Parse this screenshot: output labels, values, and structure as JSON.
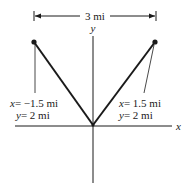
{
  "diagram": {
    "dimension": {
      "label": "3 mi"
    },
    "axes": {
      "x_label": "x",
      "y_label": "y"
    },
    "points": [
      {
        "id": "left",
        "x_var": "x",
        "x_value": "= −1.5 mi",
        "y_var": "y",
        "y_value": "= 2 mi"
      },
      {
        "id": "right",
        "x_var": "x",
        "x_value": "= 1.5 mi",
        "y_var": "y",
        "y_value": "= 2 mi"
      }
    ],
    "colors": {
      "ink": "#1a1a1a",
      "background": "#ffffff"
    }
  }
}
